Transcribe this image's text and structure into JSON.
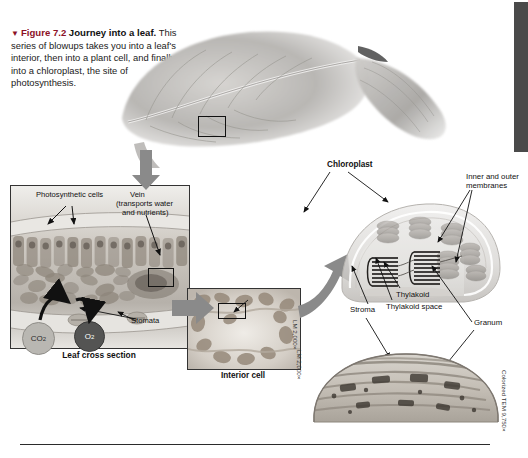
{
  "figure": {
    "marker": "▼",
    "number": "Figure 7.2",
    "title": "Journey into a leaf.",
    "body": "This series of blowups takes you into a leaf's interior, then into a plant cell, and finally into a chloroplast, the site of photosynthesis."
  },
  "panels": {
    "leaf_photo": {
      "name": "whole leaf scanning electron micrograph"
    },
    "cross_section": {
      "caption": "Leaf cross section",
      "label_photosynthetic": "Photosynthetic cells",
      "label_vein": "Vein",
      "label_vein_sub1": "(transports water",
      "label_vein_sub2": "and nutrients)",
      "label_stomata": "Stomata",
      "gas_co2": "CO",
      "gas_co2_sub": "2",
      "gas_o2": "O",
      "gas_o2_sub": "2"
    },
    "interior_cell": {
      "caption": "Interior cell",
      "credit": "LM 2,000×"
    },
    "chloroplast": {
      "label_chloroplast": "Chloroplast",
      "label_membranes_l1": "Inner and outer",
      "label_membranes_l2": "membranes",
      "label_thylakoid": "Thylakoid",
      "label_thylakoid_space": "Thylakoid space",
      "label_stroma": "Stroma",
      "label_granum": "Granum"
    },
    "tem": {
      "credit": "Colorized TEM 9,750×",
      "credit_left": "LM 2,000×"
    }
  },
  "colors": {
    "figure_marker": "#8c1127",
    "arrow_gray": "#8a8a8a",
    "sidebar": "#4a4a4a",
    "co2_fill": "#b9b7b2",
    "o2_fill": "#545453"
  }
}
